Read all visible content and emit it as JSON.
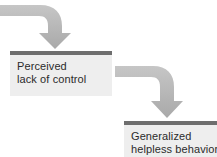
{
  "diagram": {
    "type": "flowchart",
    "background_color": "#ffffff",
    "node_fill_color": "#eeeeee",
    "node_bar_color": "#6e6e6e",
    "arrow_color": "#b3b3b3",
    "text_color": "#2b2b2b",
    "nodes": [
      {
        "id": "perceived-lack-of-control",
        "lines": [
          "Perceived",
          "lack of control"
        ],
        "x": 10,
        "y": 51,
        "width": 102,
        "height": 45
      },
      {
        "id": "generalized-helpless-behavior",
        "lines": [
          "Generalized",
          "helpless behavior"
        ],
        "x": 124,
        "y": 121,
        "width": 93,
        "height": 36
      }
    ],
    "arrows": [
      {
        "id": "arrow-into-perceived",
        "from": "left-edge",
        "to": "perceived-lack-of-control",
        "direction": "down"
      },
      {
        "id": "arrow-perceived-to-helpless",
        "from": "perceived-lack-of-control",
        "to": "generalized-helpless-behavior",
        "direction": "down"
      }
    ]
  }
}
